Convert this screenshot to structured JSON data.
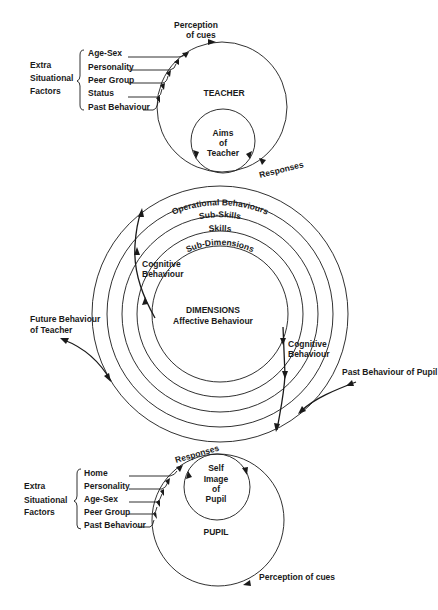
{
  "teacher": {
    "title": "TEACHER",
    "inner_circle": [
      "Aims",
      "of",
      "Teacher"
    ],
    "perception_label": [
      "Perception",
      "of cues"
    ],
    "responses_label": "Responses",
    "extra_factors_label": [
      "Extra",
      "Situational",
      "Factors"
    ],
    "factors": [
      "Age-Sex",
      "Personality",
      "Peer Group",
      "Status",
      "Past Behaviour"
    ]
  },
  "interaction": {
    "rings": [
      "Operational Behaviours",
      "Sub-Skills",
      "Skills",
      "Sub-Dimensions"
    ],
    "center_title": "DIMENSIONS",
    "center_subtitle": "Affective Behaviour",
    "left_cognitive": [
      "Cognitive",
      "Behaviour"
    ],
    "right_cognitive": [
      "Cognitive",
      "Behaviour"
    ],
    "future_behaviour": [
      "Future Behaviour",
      "of Teacher"
    ],
    "past_behaviour_pupil": "Past Behaviour of Pupil"
  },
  "pupil": {
    "title": "PUPIL",
    "inner_circle": [
      "Self",
      "Image",
      "of",
      "Pupil"
    ],
    "responses_label": "Responses",
    "perception_label": "Perception of cues",
    "extra_factors_label": [
      "Extra",
      "Situational",
      "Factors"
    ],
    "factors": [
      "Home",
      "Personality",
      "Age-Sex",
      "Peer Group",
      "Past Behaviour"
    ]
  },
  "colors": {
    "ink": "#1a1a1a",
    "background": "#ffffff"
  }
}
